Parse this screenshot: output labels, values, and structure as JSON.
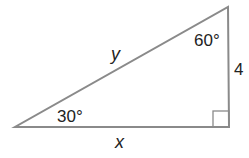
{
  "diagram": {
    "type": "right-triangle",
    "stroke_color": "#8a8a8a",
    "label_color": "#222222",
    "angles": {
      "top_right": "60°",
      "bottom_left": "30°",
      "bottom_right": "right angle"
    },
    "sides": {
      "hypotenuse": "y",
      "base": "x",
      "vertical": "4"
    }
  }
}
